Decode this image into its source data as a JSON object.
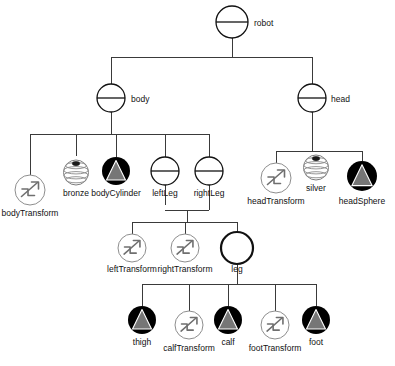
{
  "diagram": {
    "canvas": {
      "width": 395,
      "height": 366,
      "background": "#ffffff"
    },
    "legend": {
      "group_node": "circle-with-horizontal-bar",
      "shared_group_node": "thick-circle",
      "transform_node": "circle-with-zigzag-arrow",
      "material_node": "latitude-sphere",
      "geometry_node": "black-disc-with-gray-cone"
    },
    "colors": {
      "edge": "#3a3a3a",
      "group_stroke": "#111111",
      "transform_stroke": "#8e8e8e",
      "transform_glyph": "#6f6f6f",
      "material_stroke": "#7d7d7d",
      "geometry_disc": "#000000",
      "geometry_cone": "#767676",
      "label": "#111111"
    },
    "nodes": [
      {
        "id": "robot",
        "label": "robot",
        "type": "group",
        "x": 232,
        "y": 22,
        "r": 16,
        "label_x": 254,
        "label_y": 26,
        "label_anchor": "start"
      },
      {
        "id": "body",
        "label": "body",
        "type": "group",
        "x": 111,
        "y": 98,
        "r": 14,
        "label_x": 131,
        "label_y": 102,
        "label_anchor": "start"
      },
      {
        "id": "head",
        "label": "head",
        "type": "group",
        "x": 312,
        "y": 98,
        "r": 14,
        "label_x": 331,
        "label_y": 102,
        "label_anchor": "start"
      },
      {
        "id": "bodyTransform",
        "label": "bodyTransform",
        "type": "transform",
        "x": 30,
        "y": 190,
        "r": 15,
        "label_x": 30,
        "label_y": 216,
        "label_anchor": "middle"
      },
      {
        "id": "bronze",
        "label": "bronze",
        "type": "material",
        "x": 76,
        "y": 171,
        "r": 15,
        "label_x": 76,
        "label_y": 196,
        "label_anchor": "middle"
      },
      {
        "id": "bodyCylinder",
        "label": "bodyCylinder",
        "type": "geometry",
        "x": 116,
        "y": 171,
        "r": 14,
        "label_x": 116,
        "label_y": 196,
        "label_anchor": "middle"
      },
      {
        "id": "leftLeg",
        "label": "leftLeg",
        "type": "group",
        "x": 165,
        "y": 171,
        "r": 14,
        "label_x": 165,
        "label_y": 196,
        "label_anchor": "middle"
      },
      {
        "id": "rightLeg",
        "label": "rightLeg",
        "type": "group",
        "x": 209,
        "y": 171,
        "r": 14,
        "label_x": 209,
        "label_y": 196,
        "label_anchor": "middle"
      },
      {
        "id": "headTransform",
        "label": "headTransform",
        "type": "transform",
        "x": 276,
        "y": 178,
        "r": 15,
        "label_x": 276,
        "label_y": 204,
        "label_anchor": "middle"
      },
      {
        "id": "silver",
        "label": "silver",
        "type": "material",
        "x": 316,
        "y": 166,
        "r": 15,
        "label_x": 316,
        "label_y": 191,
        "label_anchor": "middle"
      },
      {
        "id": "headSphere",
        "label": "headSphere",
        "type": "geometry",
        "x": 362,
        "y": 176,
        "r": 15,
        "label_x": 362,
        "label_y": 204,
        "label_anchor": "middle"
      },
      {
        "id": "leftTransform",
        "label": "leftTransform",
        "type": "transform",
        "x": 132,
        "y": 248,
        "r": 14,
        "label_x": 132,
        "label_y": 272,
        "label_anchor": "middle"
      },
      {
        "id": "rightTransform",
        "label": "rightTransform",
        "type": "transform",
        "x": 185,
        "y": 248,
        "r": 14,
        "label_x": 185,
        "label_y": 272,
        "label_anchor": "middle"
      },
      {
        "id": "leg",
        "label": "leg",
        "type": "shared",
        "x": 237,
        "y": 248,
        "r": 16,
        "label_x": 237,
        "label_y": 272,
        "label_anchor": "middle"
      },
      {
        "id": "thigh",
        "label": "thigh",
        "type": "geometry",
        "x": 142,
        "y": 320,
        "r": 14,
        "label_x": 142,
        "label_y": 345,
        "label_anchor": "middle"
      },
      {
        "id": "calfTransform",
        "label": "calfTransform",
        "type": "transform",
        "x": 189,
        "y": 325,
        "r": 14,
        "label_x": 189,
        "label_y": 351,
        "label_anchor": "middle"
      },
      {
        "id": "calf",
        "label": "calf",
        "type": "geometry",
        "x": 228,
        "y": 320,
        "r": 14,
        "label_x": 228,
        "label_y": 345,
        "label_anchor": "middle"
      },
      {
        "id": "footTransform",
        "label": "footTransform",
        "type": "transform",
        "x": 275,
        "y": 325,
        "r": 14,
        "label_x": 275,
        "label_y": 351,
        "label_anchor": "middle"
      },
      {
        "id": "foot",
        "label": "foot",
        "type": "geometry",
        "x": 316,
        "y": 320,
        "r": 14,
        "label_x": 316,
        "label_y": 345,
        "label_anchor": "middle"
      }
    ],
    "edges": [
      {
        "from": "robot",
        "to": "body",
        "path": "M232,38 L232,57 M111,57 L312,57 M111,57 L111,84"
      },
      {
        "from": "robot",
        "to": "head",
        "path": "M312,57 L312,84"
      },
      {
        "from": "body",
        "to": "bodyTransform",
        "path": "M111,112 L111,134 M30,134 L209,134 M30,134 L30,175"
      },
      {
        "from": "body",
        "to": "bronze",
        "path": "M76,134 L76,156"
      },
      {
        "from": "body",
        "to": "bodyCylinder",
        "path": "M116,134 L116,157"
      },
      {
        "from": "body",
        "to": "leftLeg",
        "path": "M165,134 L165,157"
      },
      {
        "from": "body",
        "to": "rightLeg",
        "path": "M209,134 L209,157"
      },
      {
        "from": "head",
        "to": "headTransform",
        "path": "M312,112 L312,151 M276,151 L362,151 M276,151 L276,163"
      },
      {
        "from": "head",
        "to": "silver",
        "path": "M316,151 L316,151"
      },
      {
        "from": "head",
        "to": "headSphere",
        "path": "M362,151 L362,161"
      },
      {
        "from": "legs",
        "to": "leftTransform",
        "path": "M165,185 L165,205 M209,185 L209,210 M165,210 L209,210 M132,222 L237,222 M187,210 L187,222 M132,222 L132,234"
      },
      {
        "from": "legs",
        "to": "rightTransform",
        "path": "M185,222 L185,234"
      },
      {
        "from": "legs",
        "to": "leg",
        "path": "M237,222 L237,232"
      },
      {
        "from": "leg",
        "to": "thigh",
        "path": "M237,264 L237,284 M142,284 L316,284 M142,284 L142,306"
      },
      {
        "from": "leg",
        "to": "calfTransform",
        "path": "M189,284 L189,311"
      },
      {
        "from": "leg",
        "to": "calf",
        "path": "M228,284 L228,306"
      },
      {
        "from": "leg",
        "to": "footTransform",
        "path": "M275,284 L275,311"
      },
      {
        "from": "leg",
        "to": "foot",
        "path": "M316,284 L316,306"
      }
    ]
  }
}
